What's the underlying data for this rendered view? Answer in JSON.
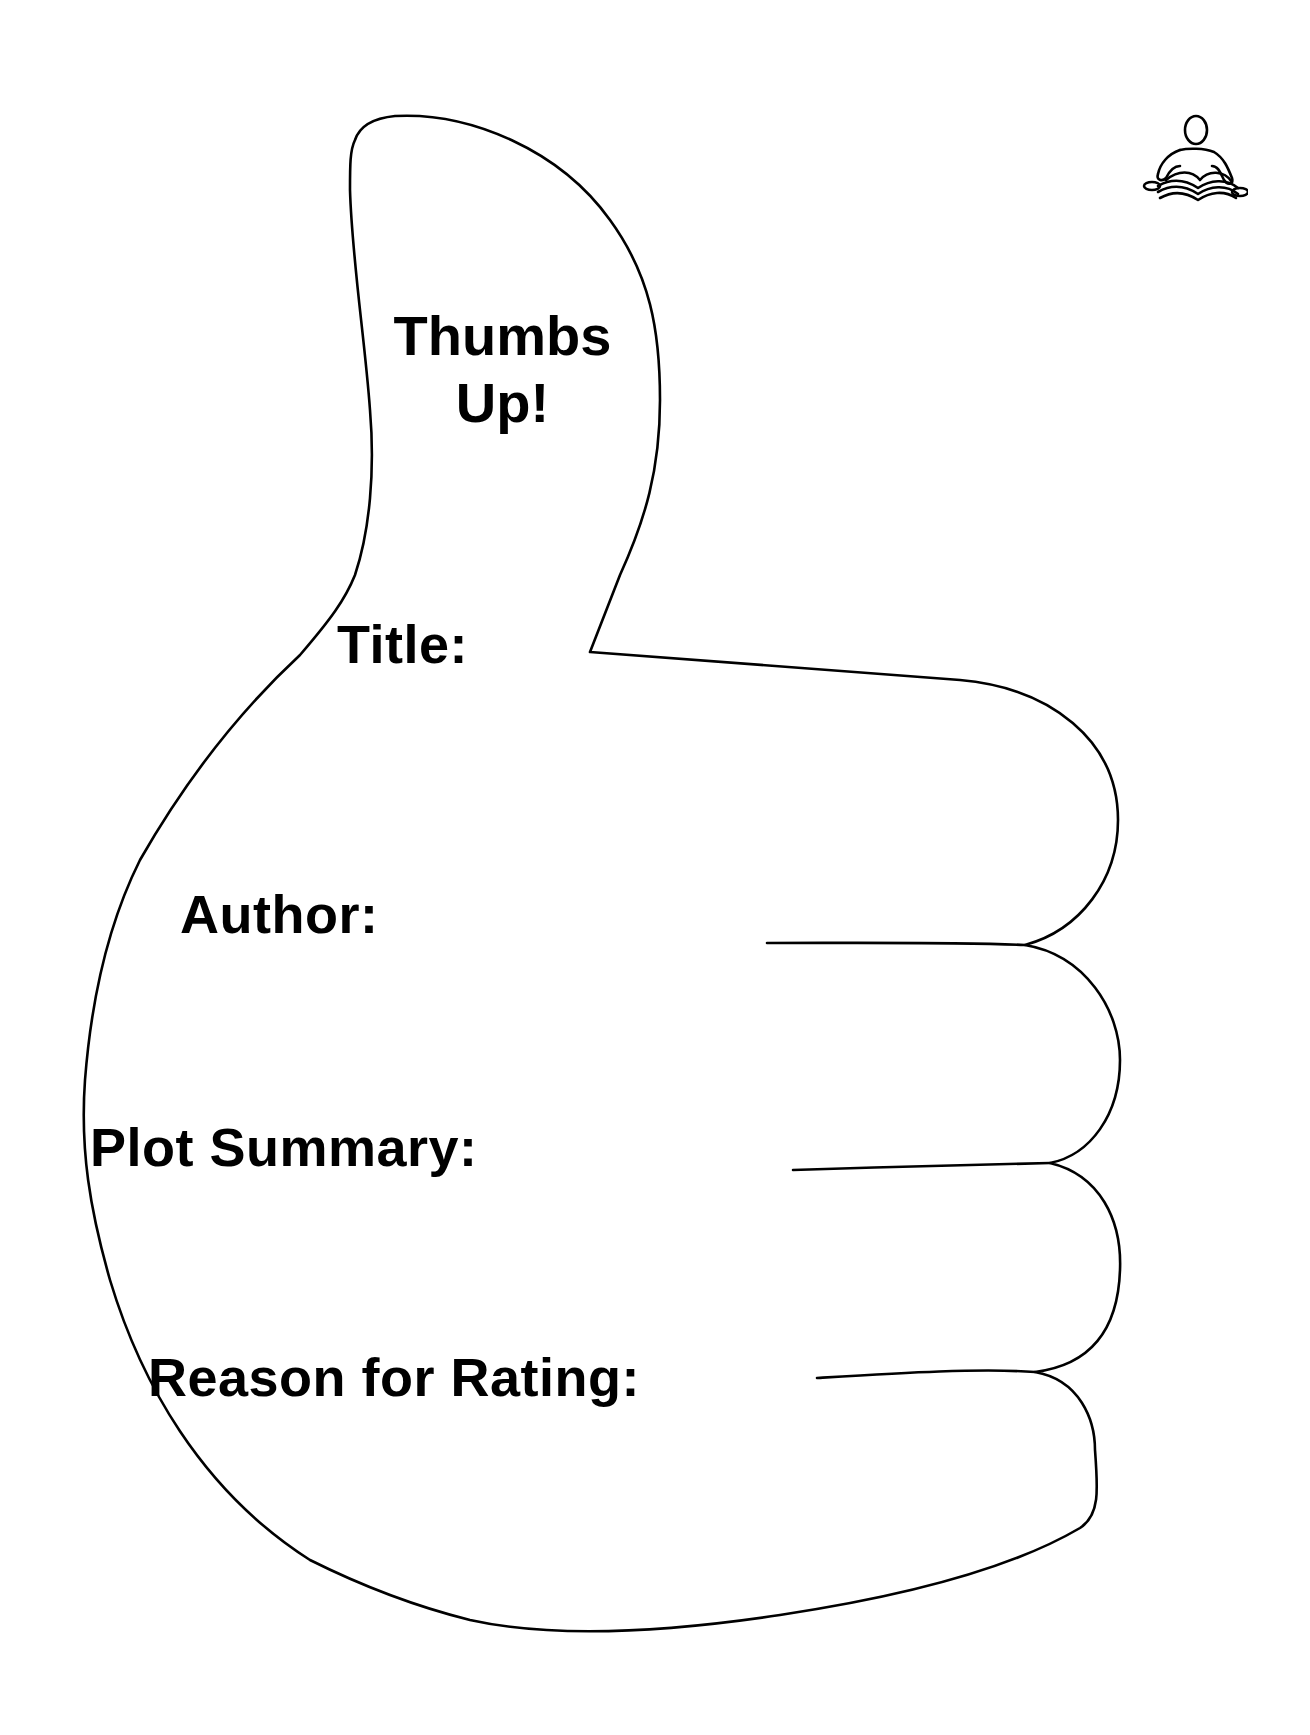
{
  "worksheet": {
    "heading_line1": "Thumbs",
    "heading_line2": "Up!",
    "fields": [
      {
        "id": "title",
        "label": "Title:"
      },
      {
        "id": "author",
        "label": "Author:"
      },
      {
        "id": "plot_summary",
        "label": "Plot Summary:"
      },
      {
        "id": "reason_for_rating",
        "label": "Reason for Rating:"
      }
    ],
    "icons": {
      "corner_icon": "person-reading-book-icon",
      "outline_shape": "thumbs-up-hand-outline"
    }
  },
  "colors": {
    "ink": "#000000",
    "paper": "#ffffff"
  }
}
